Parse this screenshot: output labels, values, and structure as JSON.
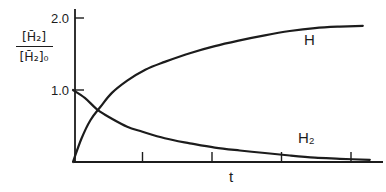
{
  "figure": {
    "background": "#ffffff",
    "line_color": "#1c1c1c"
  },
  "chart_data": {
    "type": "line",
    "title": "",
    "xlabel": "t",
    "ylabel_numerator": "[H̄₂]",
    "ylabel_denominator": "[H̄₂]₀",
    "x_axis": {
      "min": 0,
      "max": 4.46,
      "ticks": [
        1,
        2,
        3,
        4
      ],
      "tick_labels": [
        "",
        "",
        "",
        ""
      ]
    },
    "y_axis": {
      "min": 0,
      "max": 2.13,
      "ticks": [
        1.0,
        2.0
      ],
      "tick_labels": [
        "1.0",
        "2.0"
      ]
    },
    "grid": false,
    "legend": "inline curve labels",
    "series": [
      {
        "name": "H",
        "label": "H",
        "points": [
          [
            0,
            0
          ],
          [
            0.12,
            0.32
          ],
          [
            0.25,
            0.58
          ],
          [
            0.39,
            0.76
          ],
          [
            0.56,
            0.96
          ],
          [
            0.78,
            1.13
          ],
          [
            1.04,
            1.28
          ],
          [
            1.32,
            1.39
          ],
          [
            1.68,
            1.51
          ],
          [
            2.04,
            1.61
          ],
          [
            2.4,
            1.69
          ],
          [
            2.76,
            1.76
          ],
          [
            3.12,
            1.82
          ],
          [
            3.48,
            1.86
          ],
          [
            3.84,
            1.88
          ],
          [
            4.17,
            1.89
          ]
        ]
      },
      {
        "name": "H2",
        "label": "H₂",
        "points": [
          [
            0,
            1.0
          ],
          [
            0.17,
            0.89
          ],
          [
            0.36,
            0.72
          ],
          [
            0.56,
            0.6
          ],
          [
            0.78,
            0.49
          ],
          [
            1.0,
            0.42
          ],
          [
            1.32,
            0.33
          ],
          [
            1.68,
            0.26
          ],
          [
            2.04,
            0.2
          ],
          [
            2.4,
            0.16
          ],
          [
            2.76,
            0.125
          ],
          [
            3.12,
            0.09
          ],
          [
            3.48,
            0.06
          ],
          [
            3.84,
            0.045
          ],
          [
            4.27,
            0.03
          ]
        ]
      }
    ]
  }
}
